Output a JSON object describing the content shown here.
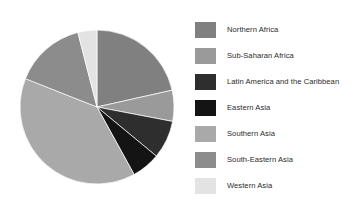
{
  "chart_data": {
    "type": "pie",
    "title": "",
    "subtitle": "",
    "xlabel": "",
    "ylabel": "",
    "grid": false,
    "legend_position": "right",
    "start_angle_deg": 0,
    "direction": "clockwise",
    "categories": [
      "Northern Africa",
      "Sub-Saharan Africa",
      "Latin America and the Caribbean",
      "Eastern Asia",
      "Southern Asia",
      "South-Eastern Asia",
      "Western Asia"
    ],
    "values": [
      21.5,
      6.5,
      8.0,
      6.0,
      39.0,
      15.0,
      4.0
    ],
    "unit": "percent",
    "colors": [
      "#808080",
      "#9a9a9a",
      "#2e2e2e",
      "#141414",
      "#a9a9a9",
      "#8c8c8c",
      "#e3e3e3"
    ],
    "slices": [
      {
        "label": "Northern Africa",
        "value": 21.5,
        "color": "#808080"
      },
      {
        "label": "Sub-Saharan Africa",
        "value": 6.5,
        "color": "#9a9a9a"
      },
      {
        "label": "Latin America and the Caribbean",
        "value": 8.0,
        "color": "#2e2e2e"
      },
      {
        "label": "Eastern Asia",
        "value": 6.0,
        "color": "#141414"
      },
      {
        "label": "Southern Asia",
        "value": 39.0,
        "color": "#a9a9a9"
      },
      {
        "label": "South-Eastern Asia",
        "value": 15.0,
        "color": "#8c8c8c"
      },
      {
        "label": "Western Asia",
        "value": 4.0,
        "color": "#e3e3e3"
      }
    ]
  },
  "legend": {
    "items": [
      {
        "label": "Northern Africa",
        "color": "#808080"
      },
      {
        "label": "Sub-Saharan Africa",
        "color": "#9a9a9a"
      },
      {
        "label": "Latin America and the Caribbean",
        "color": "#2e2e2e"
      },
      {
        "label": "Eastern Asia",
        "color": "#141414"
      },
      {
        "label": "Southern Asia",
        "color": "#a9a9a9"
      },
      {
        "label": "South-Eastern Asia",
        "color": "#8c8c8c"
      },
      {
        "label": "Western Asia",
        "color": "#e3e3e3"
      }
    ]
  },
  "figure": {
    "background": "#ffffff"
  }
}
